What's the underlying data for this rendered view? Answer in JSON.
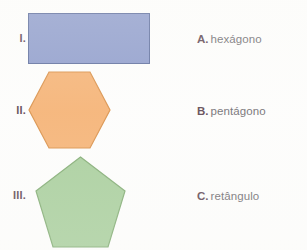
{
  "page": {
    "background_color": "#fdfdfc",
    "width": 307,
    "height": 250
  },
  "items": [
    {
      "numeral": "I.",
      "shape": "rectangle",
      "fill_color": "#8d9bcb",
      "stroke_color": "#5c6c9c"
    },
    {
      "numeral": "II.",
      "shape": "hexagon",
      "fill_color": "#f5b172",
      "stroke_color": "#d98f46"
    },
    {
      "numeral": "III.",
      "shape": "pentagon",
      "fill_color": "#a6cd9a",
      "stroke_color": "#7faa70"
    }
  ],
  "options": [
    {
      "letter": "A.",
      "label": "hexágono"
    },
    {
      "letter": "B.",
      "label": "pentágono"
    },
    {
      "letter": "C.",
      "label": "retângulo"
    }
  ],
  "colors": {
    "letter_text": "#5c4550",
    "option_text": "#6e6b70"
  }
}
